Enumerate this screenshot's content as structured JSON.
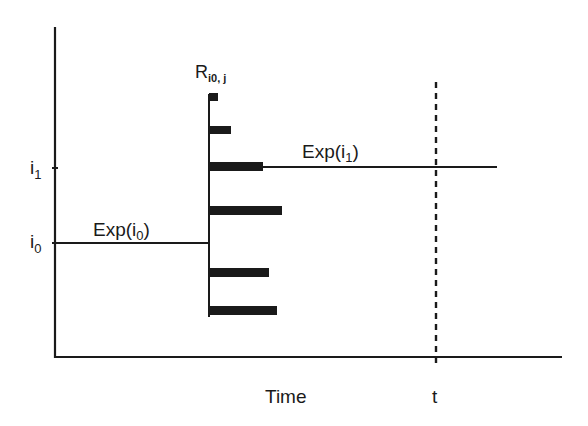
{
  "diagram": {
    "y_axis_labels": {
      "i1": {
        "main": "i",
        "sub": "1"
      },
      "i0": {
        "main": "i",
        "sub": "0"
      }
    },
    "labels": {
      "exp_i0": {
        "prefix": "Exp(i",
        "sub": "0",
        "suffix": ")"
      },
      "exp_i1": {
        "prefix": "Exp(i",
        "sub": "1",
        "suffix": ")"
      },
      "r_label": {
        "main": "R",
        "sub": "i0, j"
      }
    },
    "x_axis_label": "Time",
    "time_marker_label": "t",
    "colors": {
      "ink": "#1a1a1a",
      "background": "#ffffff"
    },
    "bars": [
      {
        "y": 97,
        "x_end": 218
      },
      {
        "y": 130,
        "x_end": 231
      },
      {
        "y": 166,
        "x_end": 263
      },
      {
        "y": 210,
        "x_end": 282
      },
      {
        "y": 272,
        "x_end": 269
      },
      {
        "y": 310,
        "x_end": 277
      }
    ]
  }
}
